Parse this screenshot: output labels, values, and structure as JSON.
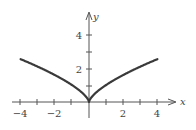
{
  "chart_data": {
    "type": "line",
    "title": "",
    "function": "y = |x|^(2/3)",
    "xlabel": "x",
    "ylabel": "y",
    "xlim": [
      -4.5,
      5
    ],
    "ylim": [
      -1,
      5.4
    ],
    "x_ticks": [
      -4,
      -3,
      -2,
      -1,
      1,
      2,
      3,
      4
    ],
    "x_tick_labels": [
      "-4",
      "-2",
      "2",
      "4"
    ],
    "y_ticks": [
      1,
      2,
      3,
      4
    ],
    "y_tick_labels": [
      "2",
      "4"
    ],
    "grid": false,
    "series": [
      {
        "name": "curve",
        "x": [
          -4,
          -3,
          -2,
          -1,
          -0.5,
          0,
          0.5,
          1,
          2,
          3,
          4
        ],
        "y": [
          2.52,
          2.08,
          1.59,
          1.0,
          0.63,
          0,
          0.63,
          1.0,
          1.59,
          2.08,
          2.52
        ],
        "color": "#3a3a3a"
      }
    ]
  },
  "labels": {
    "x_axis": "x",
    "y_axis": "y",
    "xt_m4": "−4",
    "xt_m2": "−2",
    "xt_2": "2",
    "xt_4": "4",
    "yt_2": "2",
    "yt_4": "4"
  }
}
